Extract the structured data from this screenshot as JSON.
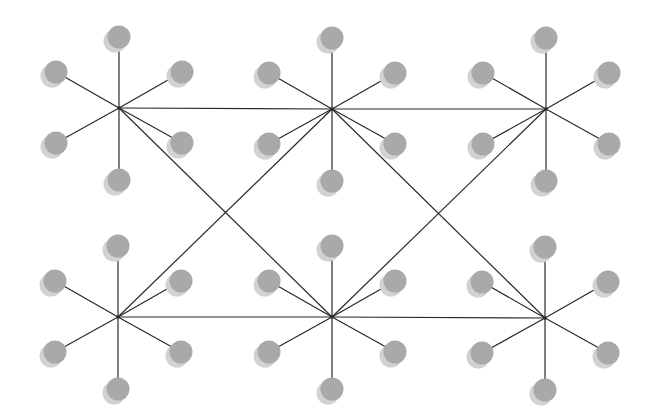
{
  "diagram": {
    "type": "network-graph",
    "width": 658,
    "height": 420,
    "colors": {
      "background": "#ffffff",
      "edge": "#2a2a2a",
      "node_fill": "#a9a9a9",
      "node_shadow": "#d2d2d2"
    },
    "node_radius": 11.5,
    "shadow_offset": [
      -4,
      4
    ],
    "leaf_offsets": [
      [
        0,
        -71
      ],
      [
        -63,
        -36
      ],
      [
        63,
        -36
      ],
      [
        -63,
        35
      ],
      [
        63,
        35
      ],
      [
        0,
        72
      ]
    ],
    "hubs": [
      {
        "id": "hub-top-left",
        "x": 119,
        "y": 108
      },
      {
        "id": "hub-top-middle",
        "x": 332,
        "y": 109
      },
      {
        "id": "hub-top-right",
        "x": 546,
        "y": 109
      },
      {
        "id": "hub-bottom-left",
        "x": 118,
        "y": 317
      },
      {
        "id": "hub-bottom-middle",
        "x": 332,
        "y": 317
      },
      {
        "id": "hub-bottom-right",
        "x": 545,
        "y": 318
      }
    ],
    "hub_edges": [
      [
        "hub-top-left",
        "hub-top-middle"
      ],
      [
        "hub-top-middle",
        "hub-top-right"
      ],
      [
        "hub-bottom-left",
        "hub-bottom-middle"
      ],
      [
        "hub-bottom-middle",
        "hub-bottom-right"
      ],
      [
        "hub-top-left",
        "hub-bottom-middle"
      ],
      [
        "hub-top-middle",
        "hub-bottom-left"
      ],
      [
        "hub-top-middle",
        "hub-bottom-right"
      ],
      [
        "hub-top-right",
        "hub-bottom-middle"
      ]
    ]
  }
}
